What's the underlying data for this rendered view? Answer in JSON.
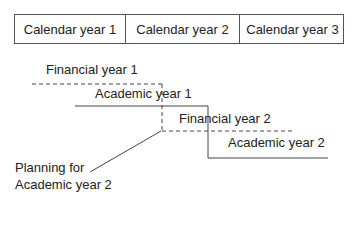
{
  "calendar_years": [
    {
      "label": "Calendar year 1",
      "width": 110
    },
    {
      "label": "Calendar year 2",
      "width": 114
    },
    {
      "label": "Calendar year 3",
      "width": 106
    }
  ],
  "periods": {
    "financial_year_1": "Financial year 1",
    "academic_year_1": "Academic year 1",
    "financial_year_2": "Financial year 2",
    "academic_year_2": "Academic year 2"
  },
  "annotation": {
    "line1": "Planning for",
    "line2": "Academic year 2"
  },
  "colors": {
    "line": "#444444",
    "text": "#222222"
  }
}
